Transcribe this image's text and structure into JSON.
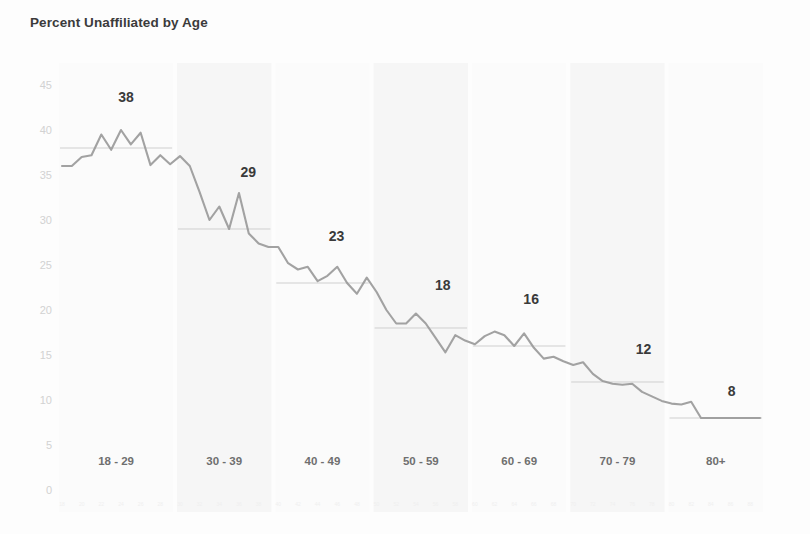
{
  "chart_data": {
    "type": "line",
    "title": "Percent Unaffiliated by Age",
    "xlabel": "",
    "ylabel": "",
    "ylim": [
      0,
      45
    ],
    "yticks": [
      0,
      5,
      10,
      15,
      20,
      25,
      30,
      35,
      40,
      45
    ],
    "grid": false,
    "legend": "none",
    "x_group_labels": [
      "18 - 29",
      "30 - 39",
      "40 - 49",
      "50 - 59",
      "60 - 69",
      "70 - 79",
      "80+"
    ],
    "group_averages": [
      38,
      29,
      23,
      18,
      16,
      12,
      8
    ],
    "group_average_label_text": [
      "38",
      "29",
      "23",
      "18",
      "16",
      "12",
      "8"
    ],
    "group_ranges": [
      [
        18,
        29
      ],
      [
        30,
        39
      ],
      [
        40,
        49
      ],
      [
        50,
        59
      ],
      [
        60,
        69
      ],
      [
        70,
        79
      ],
      [
        80,
        89
      ]
    ],
    "x": [
      18,
      19,
      20,
      21,
      22,
      23,
      24,
      25,
      26,
      27,
      28,
      29,
      30,
      31,
      32,
      33,
      34,
      35,
      36,
      37,
      38,
      39,
      40,
      41,
      42,
      43,
      44,
      45,
      46,
      47,
      48,
      49,
      50,
      51,
      52,
      53,
      54,
      55,
      56,
      57,
      58,
      59,
      60,
      61,
      62,
      63,
      64,
      65,
      66,
      67,
      68,
      69,
      70,
      71,
      72,
      73,
      74,
      75,
      76,
      77,
      78,
      79,
      80,
      81,
      82,
      83,
      84,
      85,
      86,
      87,
      88,
      89
    ],
    "values": [
      36.0,
      36.0,
      37.0,
      37.2,
      39.5,
      37.8,
      40.0,
      38.4,
      39.7,
      36.1,
      37.2,
      36.2,
      37.1,
      36.0,
      33.1,
      30.0,
      31.5,
      29.0,
      33.0,
      28.5,
      27.4,
      27.0,
      27.0,
      25.2,
      24.5,
      24.8,
      23.2,
      23.8,
      24.8,
      23.0,
      21.8,
      23.6,
      22.0,
      20.0,
      18.5,
      18.5,
      19.6,
      18.5,
      16.9,
      15.3,
      17.2,
      16.6,
      16.2,
      17.1,
      17.6,
      17.2,
      16.0,
      17.4,
      15.8,
      14.6,
      14.8,
      14.3,
      13.9,
      14.2,
      12.9,
      12.1,
      11.8,
      11.7,
      11.8,
      10.9,
      10.4,
      9.9,
      9.6,
      9.5,
      9.8,
      8.0,
      8.0,
      8.0,
      8.0,
      8.0,
      8.0,
      8.0
    ],
    "series_color": "#9a9a9a",
    "avg_line_color": "#cfcfcf",
    "y_tick_color": "#d2d2d2"
  }
}
